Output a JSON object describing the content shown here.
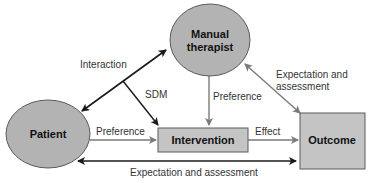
{
  "diagram": {
    "nodes": {
      "manual_therapist": {
        "line1": "Manual",
        "line2": "therapist",
        "shape": "ellipse",
        "fill": "#b3b3b3"
      },
      "patient": {
        "label": "Patient",
        "shape": "ellipse",
        "fill": "#b3b3b3"
      },
      "intervention": {
        "label": "Intervention",
        "shape": "rect",
        "fill": "#c4c4c4"
      },
      "outcome": {
        "label": "Outcome",
        "shape": "rect",
        "fill": "#c4c4c4"
      }
    },
    "edges": {
      "interaction": {
        "label": "Interaction",
        "from": "patient",
        "to": "manual_therapist",
        "bidirectional": true,
        "color": "#1a1a1a"
      },
      "sdm": {
        "label": "SDM",
        "from": "interaction",
        "to": "intervention",
        "color": "#1a1a1a"
      },
      "preference_therapist": {
        "label": "Preference",
        "from": "manual_therapist",
        "to": "intervention",
        "color": "#7a7a7a"
      },
      "preference_patient": {
        "label": "Preference",
        "from": "patient",
        "to": "intervention",
        "color": "#7a7a7a"
      },
      "effect": {
        "label": "Effect",
        "from": "intervention",
        "to": "outcome",
        "color": "#7a7a7a"
      },
      "expectation_therapist": {
        "label1": "Expectation and",
        "label2": "assessment",
        "from": "outcome",
        "to": "manual_therapist",
        "bidirectional": true,
        "color": "#7a7a7a"
      },
      "expectation_patient": {
        "label": "Expectation and assessment",
        "from": "patient",
        "to": "outcome",
        "bidirectional": true,
        "color": "#1a1a1a"
      }
    }
  }
}
